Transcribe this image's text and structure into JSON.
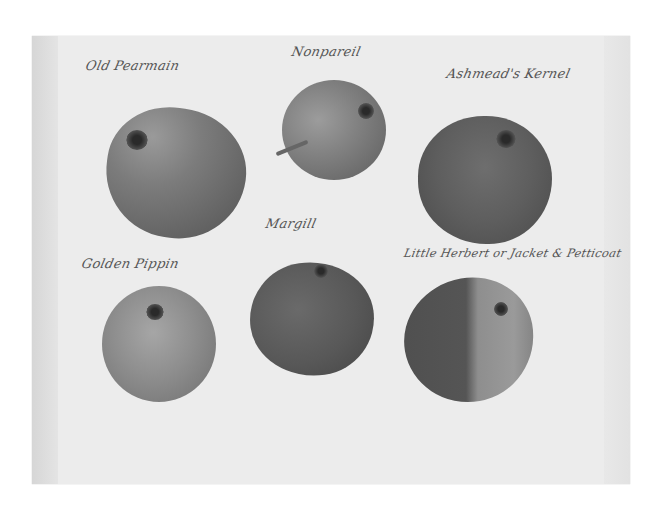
{
  "artwork": {
    "type": "botanical illustration",
    "subject": "apple varieties",
    "labels": [
      {
        "id": "old-pearmain",
        "text": "Old Pearmain"
      },
      {
        "id": "nonpareil",
        "text": "Nonpareil"
      },
      {
        "id": "ashmeads-kernel",
        "text": "Ashmead's Kernel"
      },
      {
        "id": "margill",
        "text": "Margill"
      },
      {
        "id": "golden-pippin",
        "text": "Golden Pippin"
      },
      {
        "id": "little-herbert",
        "text": "Little Herbert or Jacket & Petticoat"
      }
    ],
    "colors": {
      "paper": "#ececec",
      "ink": "#555555",
      "apple_dark": "#555555",
      "apple_mid": "#8a8a8a"
    }
  }
}
